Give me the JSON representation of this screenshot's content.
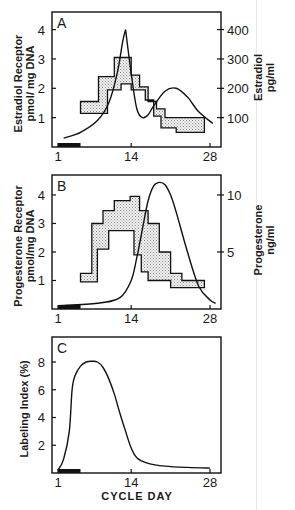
{
  "figure": {
    "x_axis_title": "CYCLE DAY",
    "x_ticks": [
      "1",
      "14",
      "28"
    ],
    "panels": [
      {
        "label": "A",
        "left_title_1": "Estradiol Receptor",
        "left_title_2": "pmol/ mg DNA",
        "left_ticks": [
          "1",
          "2",
          "3",
          "4"
        ],
        "right_title_1": "Estradiol",
        "right_title_2": "pg/ml",
        "right_ticks": [
          "100",
          "200",
          "300",
          "400"
        ]
      },
      {
        "label": "B",
        "left_title_1": "Progesterone Receptor",
        "left_title_2": "pmol/mg DNA",
        "left_ticks": [
          "1",
          "2",
          "3",
          "4"
        ],
        "right_title_1": "Progesterone",
        "right_title_2": "ng/ml",
        "right_ticks": [
          "5",
          "10"
        ]
      },
      {
        "label": "C",
        "left_title_1": "Labeling Index (%)",
        "left_ticks": [
          "2",
          "4",
          "6",
          "8"
        ]
      }
    ]
  },
  "chart_data": [
    {
      "type": "area",
      "title": "A",
      "xlabel": "Cycle Day",
      "ylabel": "Estradiol Receptor (pmol/mg DNA)",
      "y2label": "Estradiol (pg/ml)",
      "x_ticks": [
        1,
        14,
        28
      ],
      "ylim": [
        0,
        4.6
      ],
      "y2lim": [
        0,
        460
      ],
      "menses_bar_days": [
        1,
        5
      ],
      "series": [
        {
          "name": "Estradiol receptor range (upper)",
          "type": "step",
          "x": [
            5,
            8.2,
            11,
            14,
            15.5,
            17,
            18.5,
            20,
            22,
            27
          ],
          "values": [
            1.55,
            2.4,
            3.05,
            2.45,
            2.05,
            1.55,
            1.3,
            1.0,
            1.0,
            1.0
          ]
        },
        {
          "name": "Estradiol receptor range (lower)",
          "type": "step",
          "x": [
            5,
            9.8,
            12.2,
            14,
            16.5,
            18,
            19.3,
            22,
            27
          ],
          "values": [
            1.15,
            1.95,
            2.15,
            1.95,
            1.6,
            1.05,
            0.65,
            0.5,
            0.5
          ]
        },
        {
          "name": "Plasma estradiol (pg/ml)",
          "type": "line",
          "axis": "right",
          "x": [
            2,
            5,
            8,
            10,
            11.5,
            12.5,
            13,
            14,
            15,
            16,
            17,
            18,
            20,
            22,
            24,
            26,
            28.5
          ],
          "values": [
            30,
            50,
            90,
            150,
            250,
            360,
            400,
            250,
            130,
            100,
            110,
            140,
            190,
            200,
            170,
            120,
            80
          ]
        }
      ]
    },
    {
      "type": "area",
      "title": "B",
      "xlabel": "Cycle Day",
      "ylabel": "Progesterone Receptor (pmol/mg DNA)",
      "y2label": "Progesterone (ng/ml)",
      "x_ticks": [
        1,
        14,
        28
      ],
      "ylim": [
        0,
        4.7
      ],
      "y2lim": [
        0,
        11.75
      ],
      "menses_bar_days": [
        1,
        5
      ],
      "series": [
        {
          "name": "Progesterone receptor range (upper)",
          "type": "step",
          "x": [
            5,
            7,
            9,
            11,
            13.8,
            15.5,
            17,
            19,
            21,
            23,
            27
          ],
          "values": [
            1.25,
            3.0,
            3.45,
            3.8,
            3.95,
            3.45,
            3.0,
            2.0,
            1.25,
            1.0,
            1.0
          ]
        },
        {
          "name": "Progesterone receptor range (lower)",
          "type": "step",
          "x": [
            5,
            8,
            10,
            14.5,
            15.8,
            17,
            21,
            27
          ],
          "values": [
            0.95,
            2.1,
            2.75,
            1.9,
            1.3,
            1.0,
            0.75,
            0.75
          ]
        },
        {
          "name": "Plasma progesterone (ng/ml)",
          "type": "line",
          "axis": "right",
          "x": [
            1,
            8,
            12,
            14,
            15,
            16,
            17,
            18,
            19,
            20,
            21,
            22,
            24,
            26,
            28,
            29
          ],
          "values": [
            0.3,
            0.5,
            1.0,
            2.5,
            4.5,
            7.0,
            9.5,
            10.8,
            11.1,
            10.9,
            10.0,
            8.5,
            5.0,
            2.0,
            0.8,
            0.5
          ]
        }
      ]
    },
    {
      "type": "line",
      "title": "C",
      "xlabel": "CYCLE DAY",
      "ylabel": "Labeling Index (%)",
      "x_ticks": [
        1,
        14,
        28
      ],
      "ylim": [
        0,
        9.8
      ],
      "menses_bar_days": [
        1,
        5
      ],
      "series": [
        {
          "name": "Labeling index (%)",
          "x": [
            1,
            2,
            3,
            3.5,
            4,
            5,
            6,
            7,
            8,
            9,
            10,
            11,
            12,
            13,
            14,
            15,
            17,
            20,
            24,
            28
          ],
          "values": [
            0.2,
            1.0,
            3.0,
            6.0,
            7.0,
            7.7,
            8.0,
            8.05,
            8.0,
            7.6,
            6.8,
            5.7,
            4.3,
            3.0,
            1.8,
            1.1,
            0.7,
            0.5,
            0.4,
            0.35
          ]
        }
      ]
    }
  ]
}
